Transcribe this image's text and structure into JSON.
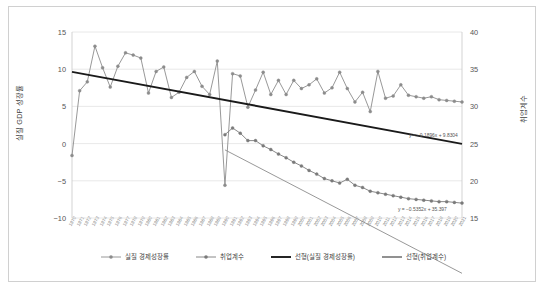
{
  "chart_data": {
    "type": "line",
    "title": "",
    "subtitle": "",
    "xlabel": "",
    "ylabel": "실질 GDP 성장률",
    "y2label": "취업계수",
    "ylim": [
      -10,
      15
    ],
    "y2lim": [
      15,
      40
    ],
    "grid": true,
    "legend_position": "bottom",
    "yticks": [
      "15",
      "10",
      "5",
      "0",
      "-5",
      "-10"
    ],
    "y2ticks": [
      "40",
      "35",
      "30",
      "25",
      "20",
      "15"
    ],
    "categories": [
      "1970",
      "1971",
      "1972",
      "1973",
      "1974",
      "1975",
      "1976",
      "1977",
      "1978",
      "1979",
      "1980",
      "1981",
      "1982",
      "1983",
      "1984",
      "1985",
      "1986",
      "1987",
      "1988",
      "1989",
      "1990",
      "1991",
      "1992",
      "1993",
      "1994",
      "1995",
      "1996",
      "1997",
      "1998",
      "1999",
      "2000",
      "2001",
      "2002",
      "2003",
      "2004",
      "2005",
      "2006",
      "2007",
      "2008",
      "2009",
      "2010",
      "2011",
      "2012",
      "2013",
      "2014",
      "2015",
      "2016",
      "2017",
      "2018",
      "2019",
      "2020",
      "2021"
    ],
    "series": [
      {
        "name": "실질 경제성장률",
        "axis": "left",
        "color": "#8c8c8c",
        "marker": "circle",
        "values": [
          -1.6,
          7.1,
          8.3,
          13.1,
          10.2,
          7.6,
          10.4,
          12.2,
          11.9,
          11.5,
          6.8,
          9.7,
          10.3,
          6.2,
          6.9,
          8.9,
          9.7,
          7.7,
          6.6,
          11.1,
          -5.6,
          9.4,
          9.1,
          4.9,
          7.2,
          9.6,
          6.6,
          8.5,
          6.6,
          8.5,
          7.4,
          7.9,
          8.7,
          6.8,
          7.5,
          9.6,
          7.4,
          5.6,
          6.9,
          4.3,
          9.7,
          6.1,
          6.4,
          7.9,
          6.5,
          6.3,
          6.1,
          6.3,
          5.9,
          5.8,
          5.7,
          5.6
        ]
      },
      {
        "name": "취업계수",
        "axis": "right",
        "color": "#7a7a7a",
        "marker": "circle",
        "values": [
          null,
          null,
          null,
          null,
          null,
          null,
          null,
          null,
          null,
          null,
          null,
          null,
          null,
          null,
          null,
          null,
          null,
          null,
          null,
          null,
          26.2,
          27.1,
          26.4,
          25.4,
          25.4,
          24.7,
          24.2,
          23.6,
          23.1,
          22.5,
          22.0,
          21.4,
          20.9,
          20.3,
          20.0,
          19.7,
          20.2,
          19.4,
          19.1,
          18.6,
          18.4,
          18.2,
          18.0,
          17.8,
          17.6,
          17.5,
          17.4,
          17.3,
          17.2,
          17.2,
          17.1,
          17.0
        ]
      }
    ],
    "trendlines": [
      {
        "name": "선형(실질 경제성장률)",
        "color": "#1a1a1a",
        "equation": "y = −0.1896x + 9.8304",
        "slope": -0.1896,
        "intercept": 9.8304,
        "axis": "left"
      },
      {
        "name": "선형(취업계수)",
        "color": "#8c8c8c",
        "equation": "y = −0.5352x + 35.397",
        "slope": -0.5352,
        "intercept": 35.397,
        "axis": "right"
      }
    ],
    "legend": [
      {
        "label": "실질 경제성장률",
        "type": "line-marker",
        "color": "#8c8c8c"
      },
      {
        "label": "취업계수",
        "type": "line-marker",
        "color": "#7a7a7a"
      },
      {
        "label": "선형(실질 경제성장률)",
        "type": "line",
        "color": "#1a1a1a"
      },
      {
        "label": "선형(취업계수)",
        "type": "line",
        "color": "#8c8c8c"
      }
    ]
  }
}
